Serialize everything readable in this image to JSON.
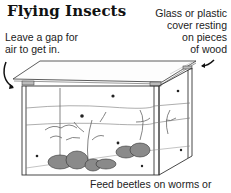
{
  "title": "Flying Insects",
  "labels": {
    "gap": [
      "Leave a gap for",
      "air to get in."
    ],
    "cover": [
      "Glass or plastic",
      "cover resting",
      "on pieces",
      "of wood"
    ],
    "feed": "Feed beetles on worms or"
  },
  "illustration": {
    "subject": "glass-tank-insect-enclosure",
    "elements": [
      "glass-cover",
      "wooden-spacers",
      "tank",
      "plants",
      "rocks",
      "insects"
    ]
  },
  "colors": {
    "ink": "#222222",
    "background": "#ffffff",
    "rock": "#8a8a8a",
    "plant": "#6a6a6a"
  }
}
